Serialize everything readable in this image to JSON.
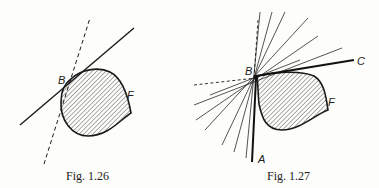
{
  "figures": [
    {
      "caption": "Fig. 1.26",
      "labels": {
        "B": "B",
        "F": "F"
      },
      "description": "Convex hatched region with a corner point B; one solid supporting line and one dashed supporting line through B"
    },
    {
      "caption": "Fig. 1.27",
      "labels": {
        "A": "A",
        "B": "B",
        "C": "C",
        "F": "F"
      },
      "description": "Hatched region with corner point B; solid rays BA and BC bound a pencil of supporting lines through B (one dashed)"
    }
  ],
  "colors": {
    "ink": "#222222",
    "background": "#fdfdfb"
  }
}
